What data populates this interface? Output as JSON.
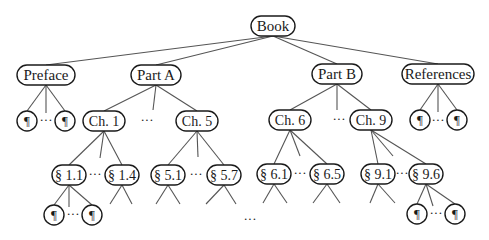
{
  "diagram": {
    "colors": {
      "stroke": "#1a1a1a",
      "edge": "#555555",
      "background": "#ffffff"
    },
    "nodes": [
      {
        "id": "book",
        "label": "Book",
        "x": 273,
        "y": 26,
        "w": 44,
        "h": 20,
        "font": 15
      },
      {
        "id": "preface",
        "label": "Preface",
        "x": 46,
        "y": 75,
        "w": 58,
        "h": 20,
        "font": 15
      },
      {
        "id": "partA",
        "label": "Part A",
        "x": 156,
        "y": 75,
        "w": 50,
        "h": 20,
        "font": 15
      },
      {
        "id": "partB",
        "label": "Part B",
        "x": 337,
        "y": 74,
        "w": 50,
        "h": 20,
        "font": 15
      },
      {
        "id": "refs",
        "label": "References",
        "x": 438,
        "y": 74,
        "w": 72,
        "h": 20,
        "font": 15
      },
      {
        "id": "p1",
        "label": "¶",
        "x": 27,
        "y": 121,
        "w": 20,
        "h": 20,
        "font": 13
      },
      {
        "id": "p2",
        "label": "¶",
        "x": 65,
        "y": 121,
        "w": 20,
        "h": 20,
        "font": 13
      },
      {
        "id": "ch1",
        "label": "Ch. 1",
        "x": 104,
        "y": 121,
        "w": 42,
        "h": 20,
        "font": 14
      },
      {
        "id": "ch5",
        "label": "Ch. 5",
        "x": 197,
        "y": 121,
        "w": 42,
        "h": 20,
        "font": 14
      },
      {
        "id": "ch6",
        "label": "Ch. 6",
        "x": 290,
        "y": 120,
        "w": 42,
        "h": 20,
        "font": 14
      },
      {
        "id": "ch9",
        "label": "Ch. 9",
        "x": 371,
        "y": 120,
        "w": 42,
        "h": 20,
        "font": 14
      },
      {
        "id": "r1",
        "label": "¶",
        "x": 420,
        "y": 120,
        "w": 20,
        "h": 20,
        "font": 13
      },
      {
        "id": "r2",
        "label": "¶",
        "x": 457,
        "y": 120,
        "w": 20,
        "h": 20,
        "font": 13
      },
      {
        "id": "s11",
        "label": "§ 1.1",
        "x": 69,
        "y": 175,
        "w": 34,
        "h": 20,
        "font": 14
      },
      {
        "id": "s14",
        "label": "§ 1.4",
        "x": 122,
        "y": 175,
        "w": 34,
        "h": 20,
        "font": 14
      },
      {
        "id": "s51",
        "label": "§ 5.1",
        "x": 168,
        "y": 175,
        "w": 34,
        "h": 20,
        "font": 14
      },
      {
        "id": "s57",
        "label": "§ 5.7",
        "x": 224,
        "y": 175,
        "w": 34,
        "h": 20,
        "font": 14
      },
      {
        "id": "s61",
        "label": "§ 6.1",
        "x": 274,
        "y": 174,
        "w": 34,
        "h": 20,
        "font": 14
      },
      {
        "id": "s65",
        "label": "§ 6.5",
        "x": 327,
        "y": 174,
        "w": 34,
        "h": 20,
        "font": 14
      },
      {
        "id": "s91",
        "label": "§ 9.1",
        "x": 378,
        "y": 174,
        "w": 34,
        "h": 20,
        "font": 14
      },
      {
        "id": "s96",
        "label": "§ 9.6",
        "x": 426,
        "y": 174,
        "w": 34,
        "h": 20,
        "font": 14
      },
      {
        "id": "q1",
        "label": "¶",
        "x": 54,
        "y": 215,
        "w": 20,
        "h": 20,
        "font": 13
      },
      {
        "id": "q2",
        "label": "¶",
        "x": 92,
        "y": 215,
        "w": 20,
        "h": 20,
        "font": 13
      },
      {
        "id": "q3",
        "label": "¶",
        "x": 417,
        "y": 214,
        "w": 20,
        "h": 20,
        "font": 13
      },
      {
        "id": "q4",
        "label": "¶",
        "x": 455,
        "y": 214,
        "w": 20,
        "h": 20,
        "font": 13
      }
    ],
    "edges": [
      [
        "book",
        "preface"
      ],
      [
        "book",
        "partA"
      ],
      [
        "book",
        "partB"
      ],
      [
        "book",
        "refs"
      ],
      [
        "preface",
        "p1"
      ],
      [
        "preface",
        "p2"
      ],
      [
        "partA",
        "ch1"
      ],
      [
        "partA",
        "ch5"
      ],
      [
        "partB",
        "ch6"
      ],
      [
        "partB",
        "ch9"
      ],
      [
        "refs",
        "r1"
      ],
      [
        "refs",
        "r2"
      ],
      [
        "ch1",
        "s11"
      ],
      [
        "ch1",
        "s14"
      ],
      [
        "ch5",
        "s51"
      ],
      [
        "ch5",
        "s57"
      ],
      [
        "ch6",
        "s61"
      ],
      [
        "ch6",
        "s65"
      ],
      [
        "ch9",
        "s91"
      ],
      [
        "ch9",
        "s96"
      ],
      [
        "s11",
        "q1"
      ],
      [
        "s11",
        "q2"
      ],
      [
        "s96",
        "q3"
      ],
      [
        "s96",
        "q4"
      ]
    ],
    "stubs": [
      {
        "from": [
          46,
          85
        ],
        "to": [
          46,
          113
        ]
      },
      {
        "from": [
          156,
          85
        ],
        "to": [
          153,
          110
        ]
      },
      {
        "from": [
          337,
          84
        ],
        "to": [
          337,
          110
        ]
      },
      {
        "from": [
          438,
          84
        ],
        "to": [
          438,
          112
        ]
      },
      {
        "from": [
          104,
          131
        ],
        "to": [
          100,
          158
        ]
      },
      {
        "from": [
          197,
          131
        ],
        "to": [
          198,
          157
        ]
      },
      {
        "from": [
          290,
          130
        ],
        "to": [
          300,
          156
        ]
      },
      {
        "from": [
          371,
          130
        ],
        "to": [
          393,
          156
        ]
      },
      {
        "from": [
          69,
          185
        ],
        "to": [
          69,
          207
        ]
      },
      {
        "from": [
          426,
          184
        ],
        "to": [
          433,
          206
        ]
      },
      {
        "from": [
          122,
          185
        ],
        "to": [
          110,
          204
        ]
      },
      {
        "from": [
          122,
          185
        ],
        "to": [
          132,
          204
        ]
      },
      {
        "from": [
          168,
          185
        ],
        "to": [
          156,
          204
        ]
      },
      {
        "from": [
          168,
          185
        ],
        "to": [
          180,
          204
        ]
      },
      {
        "from": [
          224,
          185
        ],
        "to": [
          206,
          204
        ]
      },
      {
        "from": [
          224,
          185
        ],
        "to": [
          236,
          204
        ]
      },
      {
        "from": [
          274,
          184
        ],
        "to": [
          263,
          203
        ]
      },
      {
        "from": [
          274,
          184
        ],
        "to": [
          287,
          203
        ]
      },
      {
        "from": [
          327,
          184
        ],
        "to": [
          313,
          203
        ]
      },
      {
        "from": [
          327,
          184
        ],
        "to": [
          340,
          203
        ]
      },
      {
        "from": [
          378,
          184
        ],
        "to": [
          370,
          203
        ]
      },
      {
        "from": [
          378,
          184
        ],
        "to": [
          395,
          203
        ]
      }
    ],
    "ellipses": [
      {
        "id": "dots-preface",
        "label": "···",
        "x": 46,
        "y": 121
      },
      {
        "id": "dots-partA",
        "label": "···",
        "x": 147,
        "y": 121
      },
      {
        "id": "dots-partB",
        "label": "···",
        "x": 339,
        "y": 120
      },
      {
        "id": "dots-refs",
        "label": "···",
        "x": 438,
        "y": 121
      },
      {
        "id": "dots-ch1",
        "label": "···",
        "x": 95,
        "y": 175
      },
      {
        "id": "dots-ch5",
        "label": "···",
        "x": 196,
        "y": 175
      },
      {
        "id": "dots-ch6",
        "label": "···",
        "x": 300,
        "y": 174
      },
      {
        "id": "dots-ch9",
        "label": "···",
        "x": 402,
        "y": 174
      },
      {
        "id": "dots-s11",
        "label": "···",
        "x": 73,
        "y": 215
      },
      {
        "id": "dots-s96",
        "label": "···",
        "x": 436,
        "y": 214
      },
      {
        "id": "dots-bottom",
        "label": "···",
        "x": 250,
        "y": 220
      }
    ]
  }
}
